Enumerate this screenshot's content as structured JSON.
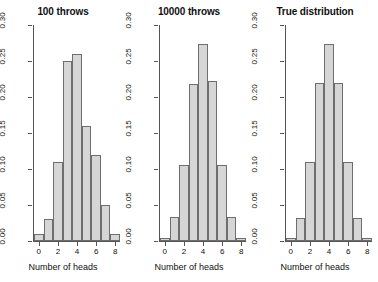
{
  "figure": {
    "width": 378,
    "height": 282,
    "background": "#ffffff",
    "bar_fill": "#d6d6d6",
    "bar_stroke": "#6e6e6e",
    "axis_color": "#555555"
  },
  "chart_data": [
    {
      "type": "bar",
      "title": "100 throws",
      "xlabel": "Number of heads",
      "ylabel": "",
      "categories": [
        "0",
        "1",
        "2",
        "3",
        "4",
        "5",
        "6",
        "7",
        "8"
      ],
      "x": [
        0,
        1,
        2,
        3,
        4,
        5,
        6,
        7,
        8
      ],
      "values": [
        0.01,
        0.03,
        0.11,
        0.25,
        0.26,
        0.16,
        0.12,
        0.05,
        0.01
      ],
      "xlim": [
        -0.5,
        8.5
      ],
      "ylim": [
        0.0,
        0.3
      ],
      "ytick_values": [
        0.0,
        0.05,
        0.1,
        0.15,
        0.2,
        0.25,
        0.3
      ],
      "ytick_labels": [
        "0.00",
        "0.05",
        "0.10",
        "0.15",
        "0.20",
        "0.25",
        "0.30"
      ],
      "xtick_values": [
        0,
        2,
        4,
        6,
        8
      ],
      "xtick_labels": [
        "0",
        "2",
        "4",
        "6",
        "8"
      ],
      "grid": false,
      "legend": "none"
    },
    {
      "type": "bar",
      "title": "10000 throws",
      "xlabel": "Number of heads",
      "ylabel": "",
      "categories": [
        "0",
        "1",
        "2",
        "3",
        "4",
        "5",
        "6",
        "7",
        "8"
      ],
      "x": [
        0,
        1,
        2,
        3,
        4,
        5,
        6,
        7,
        8
      ],
      "values": [
        0.004,
        0.033,
        0.105,
        0.218,
        0.274,
        0.222,
        0.105,
        0.033,
        0.004
      ],
      "xlim": [
        -0.5,
        8.5
      ],
      "ylim": [
        0.0,
        0.3
      ],
      "ytick_values": [
        0.0,
        0.05,
        0.1,
        0.15,
        0.2,
        0.25,
        0.3
      ],
      "ytick_labels": [
        "0.00",
        "0.05",
        "0.10",
        "0.15",
        "0.20",
        "0.25",
        "0.30"
      ],
      "xtick_values": [
        0,
        2,
        4,
        6,
        8
      ],
      "xtick_labels": [
        "0",
        "2",
        "4",
        "6",
        "8"
      ],
      "grid": false,
      "legend": "none"
    },
    {
      "type": "bar",
      "title": "True distribution",
      "xlabel": "Number of heads",
      "ylabel": "",
      "categories": [
        "0",
        "1",
        "2",
        "3",
        "4",
        "5",
        "6",
        "7",
        "8"
      ],
      "x": [
        0,
        1,
        2,
        3,
        4,
        5,
        6,
        7,
        8
      ],
      "values": [
        0.0039,
        0.0313,
        0.1094,
        0.2188,
        0.2734,
        0.2188,
        0.1094,
        0.0313,
        0.0039
      ],
      "xlim": [
        -0.5,
        8.5
      ],
      "ylim": [
        0.0,
        0.3
      ],
      "ytick_values": [
        0.0,
        0.05,
        0.1,
        0.15,
        0.2,
        0.25,
        0.3
      ],
      "ytick_labels": [
        "0.00",
        "0.05",
        "0.10",
        "0.15",
        "0.20",
        "0.25",
        "0.30"
      ],
      "xtick_values": [
        0,
        2,
        4,
        6,
        8
      ],
      "xtick_labels": [
        "0",
        "2",
        "4",
        "6",
        "8"
      ],
      "grid": false,
      "legend": "none"
    }
  ]
}
